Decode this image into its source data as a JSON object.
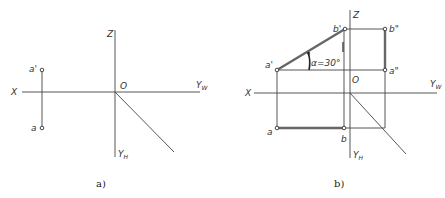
{
  "panels": [
    {
      "id": "a",
      "caption": "a)",
      "axes": {
        "x": "X",
        "z": "Z",
        "origin": "O",
        "yw": "Y",
        "yw_sub": "W",
        "yh": "Y",
        "yh_sub": "H"
      },
      "points": {
        "a_prime": "a'",
        "a": "a"
      }
    },
    {
      "id": "b",
      "caption": "b)",
      "axes": {
        "x": "X",
        "z": "Z",
        "origin": "O",
        "yw": "Y",
        "yw_sub": "W",
        "yh": "Y",
        "yh_sub": "H"
      },
      "points": {
        "a_prime": "a'",
        "b_prime": "b'",
        "b_dprime": "b\"",
        "a_dprime": "a\"",
        "a": "a",
        "b": "b"
      },
      "angle_label": "α=30°"
    }
  ],
  "colors": {
    "line": "#444444",
    "thick_line": "#666666",
    "background": "#ffffff"
  }
}
